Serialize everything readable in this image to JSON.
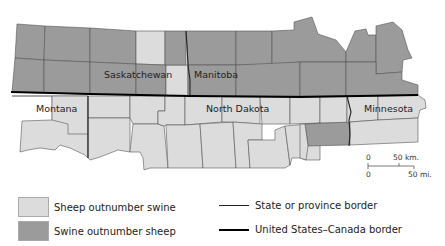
{
  "map": {
    "colors": {
      "sheep": "#dcdcdc",
      "swine": "#9b9b9b",
      "county_line": "#555555",
      "state_border": "#222222",
      "national_border": "#000000"
    },
    "labels": {
      "saskatchewan": "Saskatchewan",
      "manitoba": "Manitoba",
      "montana": "Montana",
      "north_dakota": "North Dakota",
      "minnesota": "Minnesota"
    },
    "scale": {
      "km_zero": "0",
      "km_label": "50 km.",
      "mi_zero": "0",
      "mi_label": "50 mi."
    }
  },
  "legend": {
    "items": [
      {
        "label": "Sheep outnumber swine",
        "color": "#dcdcdc"
      },
      {
        "label": "Swine outnumber sheep",
        "color": "#9b9b9b"
      }
    ],
    "lines": [
      {
        "label": "State or province border",
        "weight": "thin"
      },
      {
        "label": "United States–Canada border",
        "weight": "thick"
      }
    ]
  }
}
